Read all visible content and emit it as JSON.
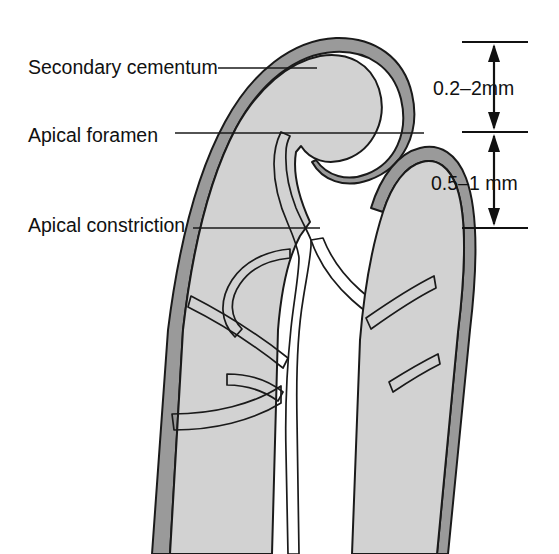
{
  "figure": {
    "background_color": "#ffffff"
  },
  "colors": {
    "cementum": "#9a9a9a",
    "dentin": "#d2d2d2",
    "canal": "#ffffff",
    "outline": "#1a1a1a",
    "text": "#111111"
  },
  "labels": [
    {
      "id": "secondary-cementum",
      "text": "Secondary cementum",
      "text_x": 28,
      "text_y": 74,
      "leader_x1": 218,
      "leader_y1": 68,
      "leader_x2": 317,
      "leader_y2": 68
    },
    {
      "id": "apical-foramen",
      "text": "Apical foramen",
      "text_x": 28,
      "text_y": 142,
      "leader_x1": 175,
      "leader_y1": 133,
      "leader_x2": 424,
      "leader_y2": 133
    },
    {
      "id": "apical-constriction",
      "text": "Apical constriction",
      "text_x": 28,
      "text_y": 232,
      "leader_x1": 193,
      "leader_y1": 228,
      "leader_x2": 320,
      "leader_y2": 228
    }
  ],
  "scale": {
    "x_center": 494,
    "tick_left": 462,
    "tick_right": 528,
    "segments": [
      {
        "id": "upper",
        "label": "0.2–2mm",
        "label_x": 433,
        "label_y": 95,
        "top_y": 42,
        "bottom_y": 132
      },
      {
        "id": "lower",
        "label": "0.5–1 mm",
        "label_x": 431,
        "label_y": 190,
        "top_y": 132,
        "bottom_y": 228
      }
    ]
  },
  "anatomy": {
    "parts": [
      {
        "id": "cementum-layer",
        "name": "secondary cementum layer",
        "fill": "#9a9a9a"
      },
      {
        "id": "dentin-body",
        "name": "root dentin",
        "fill": "#d2d2d2"
      },
      {
        "id": "pulp-canal",
        "name": "root canal space",
        "fill": "#ffffff"
      },
      {
        "id": "lateral-canals",
        "name": "accessory lateral canals",
        "fill": "#ffffff"
      }
    ]
  }
}
